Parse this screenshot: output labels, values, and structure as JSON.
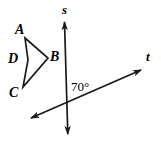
{
  "figure": {
    "background_color": "#ffffff",
    "stroke_color": "#1a1a1a",
    "canvas": {
      "width": 161,
      "height": 141
    }
  },
  "labels": {
    "vertex_a": "A",
    "vertex_b": "B",
    "vertex_c": "C",
    "vertex_d": "D",
    "line_s": "s",
    "line_t": "t",
    "angle": "70°"
  },
  "shapes": {
    "quadrilateral": {
      "name": "ABCD",
      "type": "concave-quadrilateral-dart",
      "vertices": [
        {
          "label": "A",
          "x": 25,
          "y": 38
        },
        {
          "label": "B",
          "x": 48,
          "y": 58
        },
        {
          "label": "C",
          "x": 23,
          "y": 87
        },
        {
          "label": "D",
          "x": 28,
          "y": 60
        }
      ],
      "path": "M 25,38 L 48,58 L 23,87 L 28,60 Z"
    },
    "line_s": {
      "label": "s",
      "orientation": "vertical",
      "start": {
        "x": 64,
        "y": 20
      },
      "end": {
        "x": 68,
        "y": 136
      },
      "arrows": "both"
    },
    "line_t": {
      "label": "t",
      "orientation": "oblique",
      "start": {
        "x": 30,
        "y": 119
      },
      "end": {
        "x": 142,
        "y": 70
      },
      "arrows": "both"
    },
    "intersection": {
      "x": 66,
      "y": 108
    },
    "angle_mark": {
      "value": "70°",
      "vertex": {
        "x": 66,
        "y": 108
      },
      "between_rays": [
        "s-upward",
        "t-upper-right"
      ]
    }
  }
}
